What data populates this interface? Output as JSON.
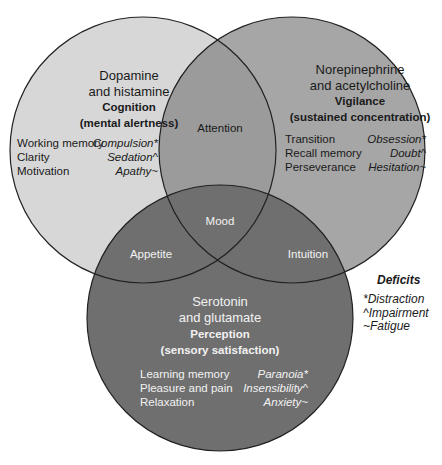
{
  "colors": {
    "left_only": "#d7d7d7",
    "right_only": "#a6a6a6",
    "left_right": "#9b9b9b",
    "bottom": "#6f6f6f",
    "outline": "#222222"
  },
  "circles": {
    "cognition": {
      "neurotransmitters_line1": "Dopamine",
      "neurotransmitters_line2": "and histamine",
      "title": "Cognition",
      "subtitle": "(mental alertness)",
      "functions": [
        "Working memory",
        "Clarity",
        "Motivation"
      ],
      "deficits": [
        "Compulsion*",
        "Sedation^",
        "Apathy~"
      ]
    },
    "vigilance": {
      "neurotransmitters_line1": "Norepinephrine",
      "neurotransmitters_line2": "and acetylcholine",
      "title": "Vigilance",
      "subtitle": "(sustained concentration)",
      "functions": [
        "Transition",
        "Recall memory",
        "Perseverance"
      ],
      "deficits": [
        "Obsession*",
        "Doubt^",
        "Hesitation~"
      ]
    },
    "perception": {
      "neurotransmitters_line1": "Serotonin",
      "neurotransmitters_line2": "and glutamate",
      "title": "Perception",
      "subtitle": "(sensory satisfaction)",
      "functions": [
        "Learning memory",
        "Pleasure and pain",
        "Relaxation"
      ],
      "deficits": [
        "Paranoia*",
        "Insensibility^",
        "Anxiety~"
      ]
    }
  },
  "overlaps": {
    "cognition_vigilance": "Attention",
    "all": "Mood",
    "cognition_perception": "Appetite",
    "vigilance_perception": "Intuition"
  },
  "legend": {
    "title": "Deficits",
    "items": [
      "*Distraction",
      "^Impairment",
      "~Fatigue"
    ]
  }
}
